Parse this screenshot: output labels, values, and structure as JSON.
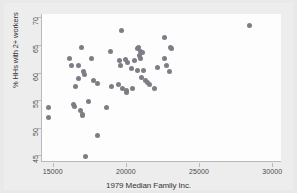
{
  "chart_data": {
    "type": "scatter",
    "title": "",
    "xlabel": "1979 Median Family Inc.",
    "ylabel": "% HHs with 2+ workers",
    "xlim": [
      14200,
      30600
    ],
    "ylim": [
      43.8,
      70.6
    ],
    "xticks": [
      15000,
      20000,
      25000,
      30000
    ],
    "xtick_labels": [
      "15000",
      "20000",
      "25000",
      "30000"
    ],
    "yticks": [
      45,
      50,
      55,
      60,
      65,
      70
    ],
    "ytick_labels": [
      "45",
      "50",
      "55",
      "60",
      "65",
      "70"
    ],
    "grid": false,
    "legend": false,
    "marker_color": "#7d7d85",
    "marker_size": 5,
    "background_color": "#e9e9e9",
    "plot_background_color": "#fdfdfd",
    "axis_color": "#b9b9b9",
    "points": [
      {
        "x": 14620,
        "y": 53.6
      },
      {
        "x": 14650,
        "y": 51.9
      },
      {
        "x": 16050,
        "y": 62.5
      },
      {
        "x": 16200,
        "y": 61.2
      },
      {
        "x": 16380,
        "y": 54.3
      },
      {
        "x": 16450,
        "y": 53.9
      },
      {
        "x": 16520,
        "y": 57.4
      },
      {
        "x": 16700,
        "y": 61.2
      },
      {
        "x": 16720,
        "y": 59.0
      },
      {
        "x": 16800,
        "y": 53.1
      },
      {
        "x": 16900,
        "y": 64.5
      },
      {
        "x": 16950,
        "y": 52.4
      },
      {
        "x": 17000,
        "y": 52.2
      },
      {
        "x": 17050,
        "y": 60.2
      },
      {
        "x": 17120,
        "y": 59.6
      },
      {
        "x": 17200,
        "y": 44.8
      },
      {
        "x": 17380,
        "y": 54.8
      },
      {
        "x": 17600,
        "y": 62.6
      },
      {
        "x": 17700,
        "y": 58.6
      },
      {
        "x": 17980,
        "y": 48.6
      },
      {
        "x": 18020,
        "y": 58.0
      },
      {
        "x": 18600,
        "y": 53.7
      },
      {
        "x": 18900,
        "y": 63.9
      },
      {
        "x": 18950,
        "y": 57.5
      },
      {
        "x": 19400,
        "y": 57.8
      },
      {
        "x": 19500,
        "y": 62.2
      },
      {
        "x": 19550,
        "y": 61.3
      },
      {
        "x": 19600,
        "y": 67.7
      },
      {
        "x": 19700,
        "y": 57.2
      },
      {
        "x": 19900,
        "y": 62.3
      },
      {
        "x": 19950,
        "y": 56.8
      },
      {
        "x": 20000,
        "y": 56.4
      },
      {
        "x": 20050,
        "y": 61.8
      },
      {
        "x": 20300,
        "y": 60.7
      },
      {
        "x": 20400,
        "y": 57.1
      },
      {
        "x": 20550,
        "y": 62.1
      },
      {
        "x": 20700,
        "y": 64.3
      },
      {
        "x": 20750,
        "y": 60.4
      },
      {
        "x": 20800,
        "y": 64.6
      },
      {
        "x": 20850,
        "y": 63.0
      },
      {
        "x": 20900,
        "y": 63.8
      },
      {
        "x": 20950,
        "y": 62.5
      },
      {
        "x": 21000,
        "y": 59.1
      },
      {
        "x": 21100,
        "y": 63.6
      },
      {
        "x": 21150,
        "y": 60.4
      },
      {
        "x": 21250,
        "y": 58.5
      },
      {
        "x": 21400,
        "y": 58.2
      },
      {
        "x": 21550,
        "y": 57.9
      },
      {
        "x": 21900,
        "y": 57.1
      },
      {
        "x": 22100,
        "y": 60.9
      },
      {
        "x": 22550,
        "y": 66.4
      },
      {
        "x": 22600,
        "y": 62.5
      },
      {
        "x": 22700,
        "y": 61.2
      },
      {
        "x": 22900,
        "y": 60.1
      },
      {
        "x": 23000,
        "y": 64.6
      },
      {
        "x": 23050,
        "y": 64.4
      },
      {
        "x": 28400,
        "y": 68.5
      }
    ]
  },
  "figure": {
    "xlabel_text": "1979 Median Family Inc.",
    "ylabel_text": "% HHs with 2+ workers"
  }
}
